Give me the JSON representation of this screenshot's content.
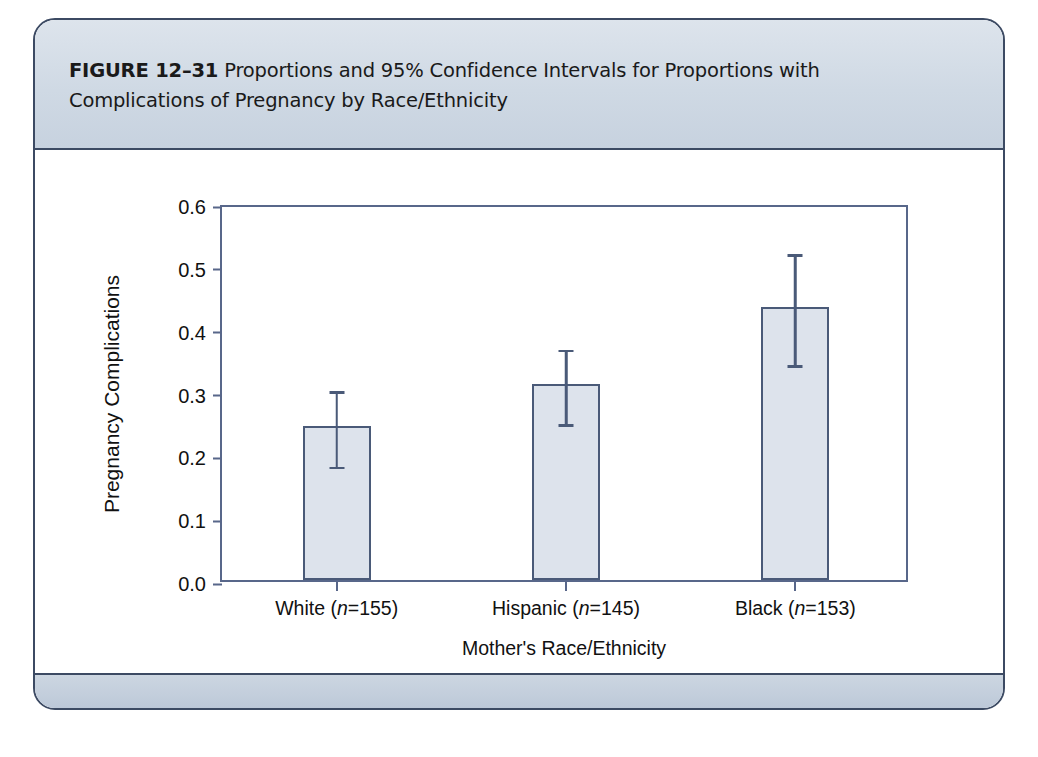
{
  "figure": {
    "label": "FIGURE 12–31",
    "caption": "Proportions and 95% Confidence Intervals for Proportions with Complications of Pregnancy by Race/Ethnicity"
  },
  "colors": {
    "frame_border": "#3c4a63",
    "caption_band": "#cfd9e4",
    "footer_band": "#c3cedc",
    "axis": "#58678a",
    "bar_fill": "#dde3ec",
    "bar_border": "#4a5a78",
    "error_bar": "#4a5a78",
    "text": "#111111"
  },
  "chart_data": {
    "type": "bar",
    "title": "",
    "xlabel": "Mother's Race/Ethnicity",
    "ylabel": "Pregnancy Complications",
    "categories": [
      "White (n=155)",
      "Hispanic (n=145)",
      "Black (n=153)"
    ],
    "category_parts": [
      {
        "group": "White",
        "n_prefix": "(n",
        "n_value": "=155)"
      },
      {
        "group": "Hispanic",
        "n_prefix": "(n",
        "n_value": "=145)"
      },
      {
        "group": "Black",
        "n_prefix": "(n",
        "n_value": "=153)"
      }
    ],
    "values": [
      0.245,
      0.312,
      0.435
    ],
    "error_low": [
      0.183,
      0.25,
      0.344
    ],
    "error_high": [
      0.307,
      0.373,
      0.525
    ],
    "error_type": "95% confidence interval",
    "ylim": [
      0.0,
      0.6
    ],
    "yticks": [
      0.0,
      0.1,
      0.2,
      0.3,
      0.4,
      0.5,
      0.6
    ],
    "ytick_labels": [
      "0.0",
      "0.1",
      "0.2",
      "0.3",
      "0.4",
      "0.5",
      "0.6"
    ],
    "grid": false,
    "legend": "none"
  }
}
